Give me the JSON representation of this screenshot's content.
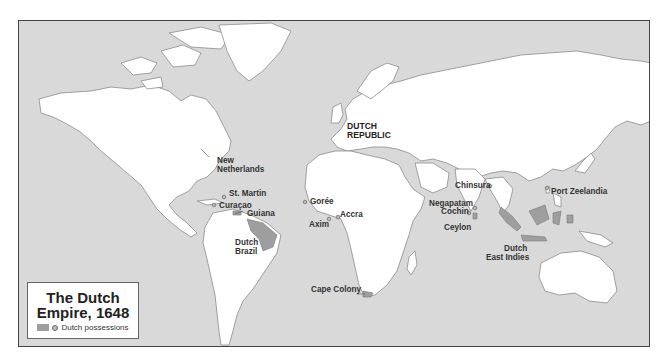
{
  "legend": {
    "title_line1": "The Dutch",
    "title_line2": "Empire, 1648",
    "item_label": "Dutch possessions",
    "swatch_color": "#9e9e9e"
  },
  "colors": {
    "ocean": "#d9d9d9",
    "land": "#ffffff",
    "dutch_possession": "#9e9e9e",
    "border": "#444444"
  },
  "labels": {
    "dutch_republic_1": "DUTCH",
    "dutch_republic_2": "REPUBLIC",
    "new_netherlands_1": "New",
    "new_netherlands_2": "Netherlands",
    "st_martin": "St. Martin",
    "curacao": "Curaçao",
    "guiana": "Guiana",
    "dutch_brazil_1": "Dutch",
    "dutch_brazil_2": "Brazil",
    "goree": "Gorée",
    "accra": "Accra",
    "axim": "Axim",
    "cape_colony": "Cape Colony",
    "chinsura": "Chinsura",
    "negapatam": "Negapatam",
    "cochin": "Cochin",
    "ceylon": "Ceylon",
    "dutch_east_indies_1": "Dutch",
    "dutch_east_indies_2": "East Indies",
    "port_zeelandia": "Port Zeelandia"
  }
}
